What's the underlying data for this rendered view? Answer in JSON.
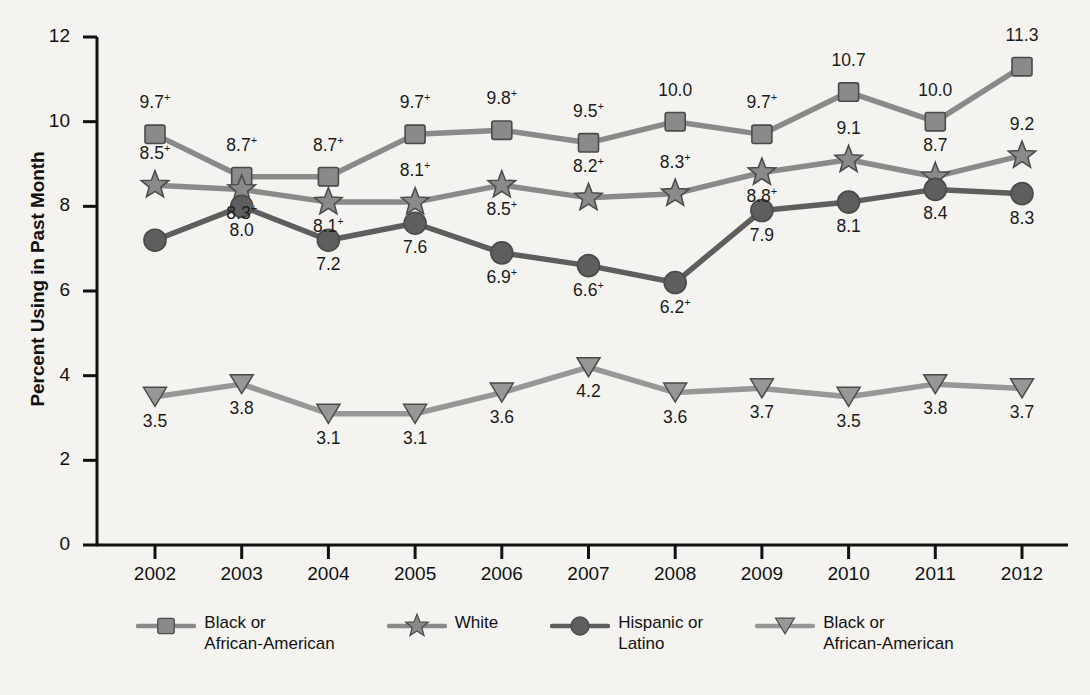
{
  "chart_data": {
    "type": "line",
    "title": "",
    "xlabel": "",
    "ylabel": "Percent Using in Past Month",
    "categories": [
      "2002",
      "2003",
      "2004",
      "2005",
      "2006",
      "2007",
      "2008",
      "2009",
      "2010",
      "2011",
      "2012"
    ],
    "ylim": [
      0,
      12
    ],
    "yticks": [
      "0",
      "2",
      "4",
      "6",
      "8",
      "10",
      "12"
    ],
    "grid": false,
    "legend_position": "bottom",
    "series": [
      {
        "name": "Black or African-American",
        "marker": "square",
        "color": "#8a8a8a",
        "values": [
          9.7,
          8.7,
          8.7,
          9.7,
          9.8,
          9.5,
          10.0,
          9.7,
          10.7,
          10.0,
          11.3
        ],
        "labels": [
          "9.7+",
          "8.7+",
          "8.7+",
          "9.7+",
          "9.8+",
          "9.5+",
          "10.0",
          "9.7+",
          "10.7",
          "10.0",
          "11.3"
        ]
      },
      {
        "name": "White",
        "marker": "star",
        "color": "#8a8a8a",
        "values": [
          8.5,
          8.4,
          8.1,
          8.1,
          8.5,
          8.2,
          8.3,
          8.8,
          9.1,
          8.7,
          9.2
        ],
        "labels": [
          "8.5+",
          "8.3+",
          "8.1+",
          "8.1+",
          "8.5+",
          "8.2+",
          "8.3+",
          "8.8+",
          "9.1",
          "8.7",
          "9.2"
        ]
      },
      {
        "name": "Hispanic or Latino",
        "marker": "circle",
        "color": "#5e5e5e",
        "values": [
          7.2,
          8.0,
          7.2,
          7.6,
          6.9,
          6.6,
          6.2,
          7.9,
          8.1,
          8.4,
          8.3
        ],
        "labels": [
          "",
          "8.0",
          "7.2",
          "7.6",
          "6.9+",
          "6.6+",
          "6.2+",
          "7.9",
          "8.1",
          "8.4",
          "8.3"
        ]
      },
      {
        "name": "Black or African-American",
        "marker": "triangle-down",
        "color": "#979797",
        "values": [
          3.5,
          3.8,
          3.1,
          3.1,
          3.6,
          4.2,
          3.6,
          3.7,
          3.5,
          3.8,
          3.7
        ],
        "labels": [
          "3.5",
          "3.8",
          "3.1",
          "3.1",
          "3.6",
          "4.2",
          "3.6",
          "3.7",
          "3.5",
          "3.8",
          "3.7"
        ]
      }
    ],
    "legend": [
      {
        "label": "Black or\nAfrican-American",
        "marker": "square",
        "color": "#8a8a8a"
      },
      {
        "label": "White",
        "marker": "star",
        "color": "#8a8a8a"
      },
      {
        "label": "Hispanic or\nLatino",
        "marker": "circle",
        "color": "#5e5e5e"
      },
      {
        "label": "Black or\nAfrican-American",
        "marker": "triangle-down",
        "color": "#979797"
      }
    ]
  }
}
